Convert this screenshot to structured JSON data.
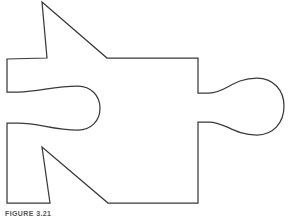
{
  "figure": {
    "caption": "FIGURE 3.21",
    "title": "Jigsaw puzzle piece outline",
    "colors": {
      "stroke": "#3a3a3a",
      "fill": "#ffffff",
      "background": "#ffffff",
      "caption_text": "#555555"
    },
    "stroke_width": 1.25,
    "canvas": {
      "width": 290,
      "height": 220
    },
    "shape": {
      "type": "closed-outline",
      "name": "puzzle-piece",
      "path": "M 42 2 L 47 58 L 7 59 L 7 92 L 18 92 C 40 92 52 86 78 86 C 91 86 100 96 100 108 C 100 121 91 130 78 130 C 52 130 40 123 18 123 L 7 123 L 7 203 L 50 203 L 42 147 L 108 203 L 198 203 L 198 122 L 209 122 C 226 122 233 135 257 135 C 273 135 284 123 284 106 C 284 90 273 78 257 78 C 233 78 226 93 209 93 L 198 93 L 198 58 L 107 58 Z",
      "features": [
        {
          "name": "top-spike",
          "apex": [
            42,
            2
          ],
          "base_left": [
            47,
            58
          ],
          "base_right": [
            107,
            58
          ]
        },
        {
          "name": "left-socket",
          "center": [
            78,
            108
          ],
          "radius": 22,
          "neck_top_y": 92,
          "neck_bottom_y": 123,
          "edge_x": 7
        },
        {
          "name": "right-knob",
          "center": [
            257,
            106
          ],
          "radius": 27,
          "neck_top_y": 93,
          "neck_bottom_y": 122,
          "edge_x": 198
        },
        {
          "name": "bottom-notch",
          "apex": [
            42,
            147
          ],
          "base_left": [
            50,
            203
          ],
          "base_right": [
            108,
            203
          ]
        },
        {
          "name": "body-top-edge",
          "y": 58,
          "x_from": 107,
          "x_to": 198
        },
        {
          "name": "body-bottom-edge",
          "y": 203,
          "x_from": 108,
          "x_to": 198
        },
        {
          "name": "body-right-edge",
          "x": 198,
          "y_from": 58,
          "y_to": 203
        },
        {
          "name": "body-left-edge",
          "x": 7,
          "y_from": 59,
          "y_to": 203
        }
      ]
    }
  }
}
